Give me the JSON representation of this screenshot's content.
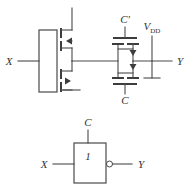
{
  "figure": {
    "width": 191,
    "height": 191,
    "background_color": "#ffffff",
    "line_color": "#4a4a4a"
  },
  "schematic": {
    "input_label": "X",
    "output_label": "Y",
    "supply_label": "V",
    "supply_sub": "DD",
    "control_label": "C",
    "control_complement_label": "C′",
    "transistors": [
      {
        "name": "pmos-left-inverter",
        "type": "PMOS"
      },
      {
        "name": "nmos-left-inverter",
        "type": "NMOS"
      },
      {
        "name": "pmos-pass-gate",
        "type": "PMOS"
      },
      {
        "name": "nmos-pass-gate",
        "type": "NMOS"
      }
    ]
  },
  "symbol": {
    "input_label": "X",
    "output_label": "Y",
    "control_label": "C",
    "body_label": "1",
    "has_inversion_bubble": true
  }
}
